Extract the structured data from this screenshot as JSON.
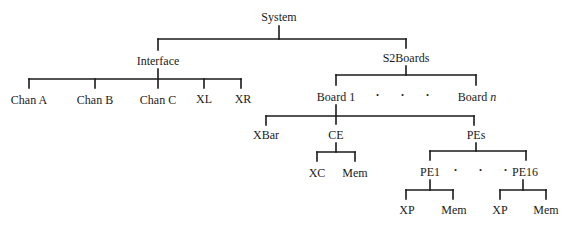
{
  "diagram": {
    "type": "hierarchy-tree",
    "root": {
      "label": "System",
      "children": [
        {
          "label": "Interface",
          "children": [
            {
              "label": "Chan A"
            },
            {
              "label": "Chan B"
            },
            {
              "label": "Chan C"
            },
            {
              "label": "XL"
            },
            {
              "label": "XR"
            }
          ]
        },
        {
          "label": "S2Boards",
          "children": [
            {
              "label": "Board 1",
              "children": [
                {
                  "label": "XBar"
                },
                {
                  "label": "CE",
                  "children": [
                    {
                      "label": "XC"
                    },
                    {
                      "label": "Mem"
                    }
                  ]
                },
                {
                  "label": "PEs",
                  "children": [
                    {
                      "label": "PE1",
                      "children": [
                        {
                          "label": "XP"
                        },
                        {
                          "label": "Mem"
                        }
                      ]
                    },
                    {
                      "label": "· · ·"
                    },
                    {
                      "label": "PE16",
                      "children": [
                        {
                          "label": "XP"
                        },
                        {
                          "label": "Mem"
                        }
                      ]
                    }
                  ]
                }
              ]
            },
            {
              "label": "· · ·"
            },
            {
              "label": "Board n"
            }
          ]
        }
      ]
    }
  },
  "labels": {
    "system": "System",
    "interface": "Interface",
    "chan_a": "Chan A",
    "chan_b": "Chan B",
    "chan_c": "Chan C",
    "xl": "XL",
    "xr": "XR",
    "s2boards": "S2Boards",
    "board_1": "Board 1",
    "boards_ellipsis": "· · ·",
    "board_n_prefix": "Board ",
    "board_n_var": "n",
    "xbar": "XBar",
    "ce": "CE",
    "xc": "XC",
    "ce_mem": "Mem",
    "pes": "PEs",
    "pe1": "PE1",
    "pes_ellipsis": "· · ·",
    "pe16": "PE16",
    "pe1_xp": "XP",
    "pe1_mem": "Mem",
    "pe16_xp": "XP",
    "pe16_mem": "Mem"
  },
  "colors": {
    "line": "#1a1a1a",
    "text": "#1a1a1a",
    "background": "#ffffff"
  }
}
